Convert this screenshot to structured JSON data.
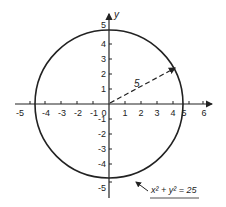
{
  "diagram": {
    "axes": {
      "x_label": "",
      "y_label": "y",
      "x_ticks": [
        "-5",
        "-4",
        "-3",
        "-2",
        "-1",
        "0",
        "1",
        "2",
        "3",
        "4",
        "5",
        "6"
      ],
      "y_ticks_pos": [
        "1",
        "2",
        "3",
        "4",
        "5"
      ],
      "y_ticks_neg": [
        "-1",
        "-2",
        "-3",
        "-4",
        "-5"
      ]
    },
    "circle": {
      "center": [
        0,
        0
      ],
      "radius": 5
    },
    "radius_label": "5",
    "equation_label": "x² + y² = 25",
    "colors": {
      "ink": "#222222",
      "background": "#ffffff"
    }
  }
}
